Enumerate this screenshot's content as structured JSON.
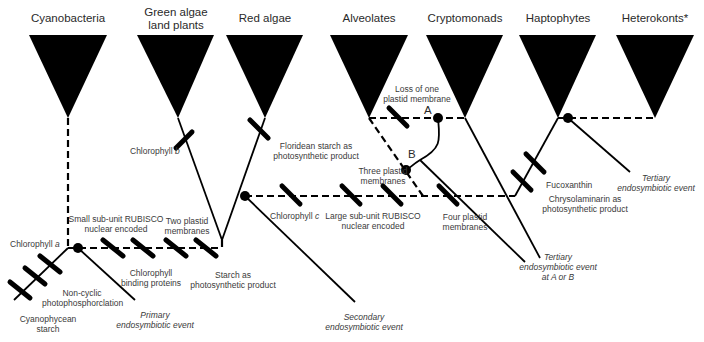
{
  "diagram": {
    "type": "phylogenetic-tree",
    "taxa": [
      {
        "id": "cyanobacteria",
        "label": "Cyanobacteria"
      },
      {
        "id": "green-algae",
        "label_line1": "Green algae",
        "label_line2": "land plants"
      },
      {
        "id": "red-algae",
        "label": "Red algae"
      },
      {
        "id": "alveolates",
        "label": "Alveolates"
      },
      {
        "id": "cryptomonads",
        "label": "Cryptomonads"
      },
      {
        "id": "haptophytes",
        "label": "Haptophytes"
      },
      {
        "id": "heterokonts",
        "label": "Heterokonts*"
      }
    ],
    "traits": {
      "chlorophyll_a": {
        "prefix": "Chlorophyll ",
        "suffix": "a"
      },
      "non_cyclic": {
        "line1": "Non-cyclic",
        "line2": "photophosphorclation"
      },
      "cyanophycean": {
        "line1": "Cyanophycean",
        "line2": "starch"
      },
      "small_rubisco": {
        "line1": "Small sub-unit RUBISCO",
        "line2": "nuclear encoded"
      },
      "two_plastid": {
        "line1": "Two plastid",
        "line2": "membranes"
      },
      "chl_binding": {
        "line1": "Chlorophyll",
        "line2": "binding proteins"
      },
      "starch": {
        "line1": "Starch as",
        "line2": "photosynthetic product"
      },
      "chlorophyll_b": {
        "prefix": "Chlorophyll ",
        "suffix": "b"
      },
      "floridean": {
        "line1": "Floridean starch as",
        "line2": "photosynthetic product"
      },
      "chlorophyll_c": {
        "prefix": "Chlorophyll ",
        "suffix": "c"
      },
      "large_rubisco": {
        "line1": "Large sub-unit RUBISCO",
        "line2": "nuclear encoded"
      },
      "three_plastid": {
        "line1": "Three plastid",
        "line2": "membranes"
      },
      "four_plastid": {
        "line1": "Four plastid",
        "line2": "membranes"
      },
      "loss_membrane": {
        "line1": "Loss of one",
        "line2": "plastid membrane"
      },
      "fucoxanthin": {
        "label": "Fucoxanthin"
      },
      "chrysolaminarin": {
        "line1": "Chrysolaminarin as",
        "line2": "photosynthetic product"
      }
    },
    "events": {
      "primary": {
        "line1": "Primary",
        "line2": "endosymbiotic event"
      },
      "secondary": {
        "line1": "Secondary",
        "line2": "endosymbiotic event"
      },
      "tertiary_ab": {
        "line1": "Tertiary",
        "line2": "endosymbiotic event",
        "line3": "at A or B"
      },
      "tertiary": {
        "line1": "Tertiary",
        "line2": "endosymbiotic event"
      }
    },
    "points": {
      "a": "A",
      "b": "B"
    },
    "colors": {
      "ink": "#000000",
      "text": "#3a3a3a",
      "background": "#ffffff"
    }
  }
}
